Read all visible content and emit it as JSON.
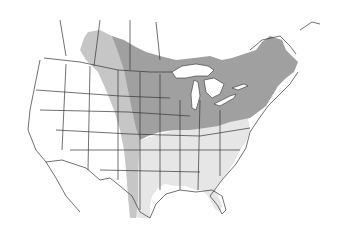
{
  "map": {
    "type": "range-map",
    "region": "North America (United States and southern Canada)",
    "colors": {
      "background": "#ffffff",
      "land": "#ffffff",
      "border": "#333333",
      "range_primary": "#a0a0a0",
      "range_secondary": "#c6c6c6",
      "range_tertiary": "#e6e6e6"
    },
    "zones": [
      {
        "name": "core-range",
        "shade": "dark-gray",
        "description": "Northern plains, Great Lakes and northeastern states and adjacent Canada"
      },
      {
        "name": "peripheral-range",
        "shade": "medium-gray",
        "description": "Northwestern band along Canadian prairies and western Great Plains"
      },
      {
        "name": "southern-range",
        "shade": "light-gray",
        "description": "Southeastern United States including Texas, Gulf Coast and Florida"
      }
    ]
  }
}
